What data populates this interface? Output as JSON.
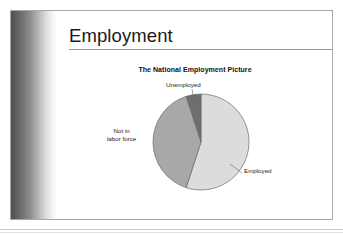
{
  "slide": {
    "title": "Employment"
  },
  "chart_data": {
    "type": "pie",
    "title": "The National Employment Picture",
    "xlabel": "",
    "ylabel": "",
    "legend_position": "none",
    "grid": false,
    "labels": [
      "Employed",
      "Not in labor force",
      "Unemployed"
    ],
    "values": [
      55,
      40,
      5
    ],
    "slices": [
      {
        "label": "Employed",
        "value": 55,
        "color": "#dcdcdc",
        "start_angle_deg": 0,
        "end_angle_deg": 198
      },
      {
        "label": "Not in labor force",
        "value": 40,
        "color": "#a8a8a8",
        "start_angle_deg": 198,
        "end_angle_deg": 342
      },
      {
        "label": "Unemployed",
        "value": 5,
        "color": "#6e6e6e",
        "start_angle_deg": 342,
        "end_angle_deg": 360
      }
    ],
    "labels_detail": {
      "unemployed": "Unemployed",
      "not_in_labor_force_line1": "Not in",
      "not_in_labor_force_line2": "labor force",
      "employed": "Employed"
    },
    "colors": {
      "employed": "#dcdcdc",
      "not_in_labor_force": "#a8a8a8",
      "unemployed": "#6e6e6e",
      "outline": "#6b6b6b"
    }
  }
}
